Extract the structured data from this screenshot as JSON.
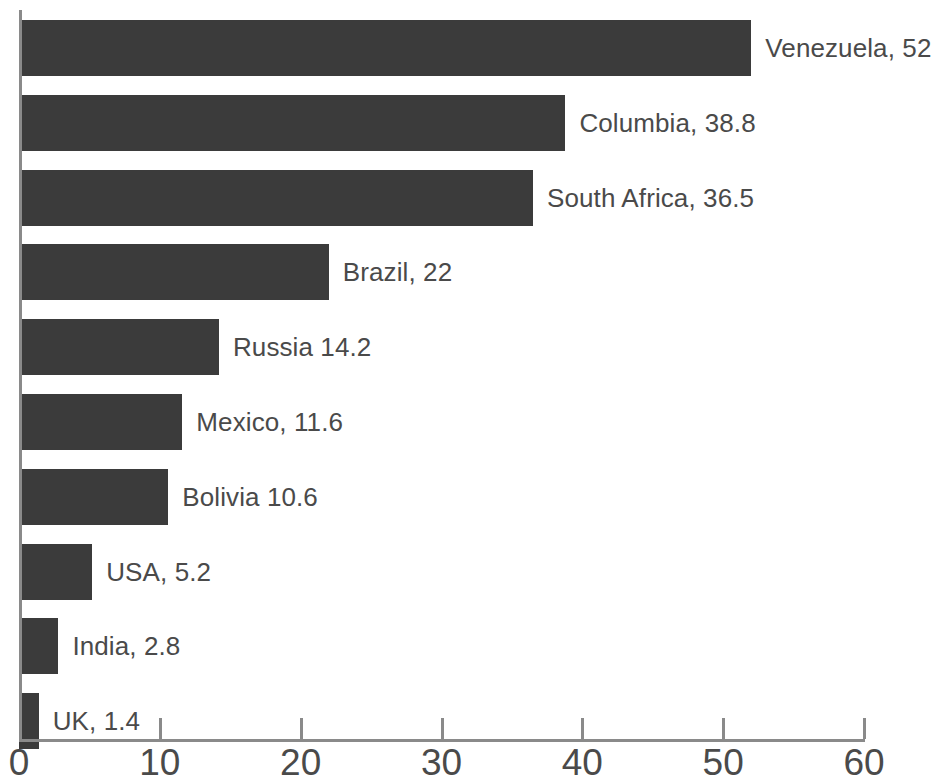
{
  "chart_data": {
    "type": "bar",
    "orientation": "horizontal",
    "title": "",
    "subtitle": "",
    "xlabel": "",
    "ylabel": "",
    "xlim": [
      0,
      60
    ],
    "ylim": null,
    "grid": false,
    "legend": null,
    "legend_position": "none",
    "bar_color": "#3b3b3b",
    "axis_color": "#8a8a8a",
    "text_color": "#4a4a4a",
    "background_color": "#ffffff",
    "categories": [
      "Venezuela",
      "Columbia",
      "South Africa",
      "Brazil",
      "Russia",
      "Mexico",
      "Bolivia",
      "USA",
      "India",
      "UK"
    ],
    "values": [
      52,
      38.8,
      36.5,
      22,
      14.2,
      11.6,
      10.6,
      5.2,
      2.8,
      1.4
    ],
    "data_labels": [
      "Venezuela, 52",
      "Columbia, 38.8",
      "South Africa, 36.5",
      "Brazil, 22",
      "Russia 14.2",
      "Mexico, 11.6",
      "Bolivia 10.6",
      "USA, 5.2",
      "India, 2.8",
      "UK, 1.4"
    ],
    "xticks": [
      0,
      10,
      20,
      30,
      40,
      50,
      60
    ],
    "xtick_labels": [
      "0",
      "10",
      "20",
      "30",
      "40",
      "50",
      "60"
    ],
    "annotations": []
  }
}
